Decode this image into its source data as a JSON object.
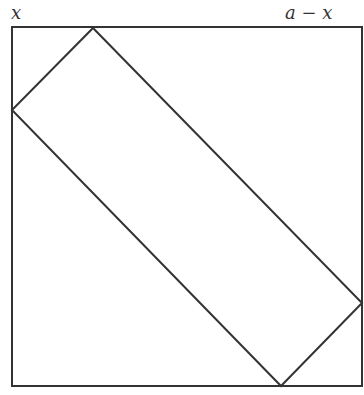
{
  "labels": {
    "left_segment": "x",
    "right_segment": "a − x"
  },
  "geometry": {
    "square": {
      "x": 12,
      "y": 27,
      "size": 350
    },
    "rectangle_vertices": [
      [
        93,
        28
      ],
      [
        362,
        303
      ],
      [
        281,
        386
      ],
      [
        12,
        110
      ]
    ]
  },
  "colors": {
    "stroke": "#333333",
    "background": "#ffffff"
  }
}
